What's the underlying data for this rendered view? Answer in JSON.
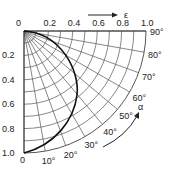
{
  "diagram": {
    "type": "polar quarter-circle chart",
    "axis_top": {
      "label": "ε",
      "ticks": [
        "0",
        "0.2",
        "0.4",
        "0.6",
        "0.8",
        "1.0"
      ]
    },
    "axis_left": {
      "ticks": [
        "0.2",
        "0.4",
        "0.6",
        "0.8",
        "1.0"
      ]
    },
    "bottom_label": "0",
    "angle_label": "α",
    "angle_ticks": [
      "10°",
      "20°",
      "30°",
      "40°",
      "50°",
      "60°",
      "70°",
      "80°",
      "90°"
    ]
  }
}
